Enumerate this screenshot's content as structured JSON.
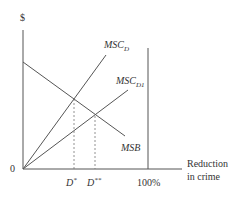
{
  "diagram": {
    "y_axis_label": "$",
    "origin_label": "0",
    "x_axis_label_line1": "Reduction",
    "x_axis_label_line2": "in crime",
    "x_ticks": {
      "d_star": "D",
      "d_star_sup": "*",
      "d_dstar": "D",
      "d_dstar_sup": "**",
      "hundred": "100%"
    },
    "curves": {
      "msc_d": {
        "name": "MSC",
        "sub": "D"
      },
      "msc_d1": {
        "name": "MSC",
        "sub": "D1"
      },
      "msb": {
        "name": "MSB"
      }
    },
    "colors": {
      "line": "#555555",
      "text": "#333333"
    }
  }
}
